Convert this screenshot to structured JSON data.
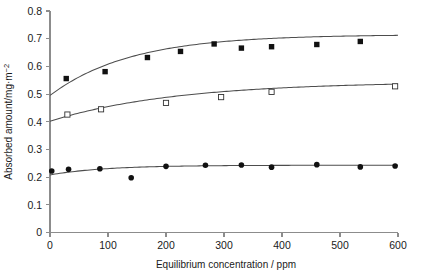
{
  "chart_data": {
    "type": "scatter",
    "title": "",
    "xlabel": "Equilibrium concentration / ppm",
    "ylabel": "Absorbed amount/mg·m",
    "ylabel_superscript": "−2",
    "xlim": [
      0,
      600
    ],
    "ylim": [
      0,
      0.8
    ],
    "xticks": [
      0,
      100,
      200,
      300,
      400,
      500,
      600
    ],
    "xticklabels": [
      "0",
      "100",
      "200",
      "300",
      "400",
      "500",
      "600"
    ],
    "yticks": [
      0,
      0.1,
      0.2,
      0.3,
      0.4,
      0.5,
      0.6,
      0.7,
      0.8
    ],
    "yticklabels": [
      "0",
      "0.1",
      "0.2",
      "0.3",
      "0.4",
      "0.5",
      "0.6",
      "0.7",
      "0.8"
    ],
    "grid": false,
    "legend": "none",
    "series": [
      {
        "name": "Series 1",
        "marker": "filled-square",
        "points": [
          {
            "x": 28,
            "y": 0.556
          },
          {
            "x": 95,
            "y": 0.581
          },
          {
            "x": 168,
            "y": 0.632
          },
          {
            "x": 225,
            "y": 0.654
          },
          {
            "x": 283,
            "y": 0.681
          },
          {
            "x": 330,
            "y": 0.666
          },
          {
            "x": 382,
            "y": 0.671
          },
          {
            "x": 460,
            "y": 0.679
          },
          {
            "x": 535,
            "y": 0.69
          }
        ],
        "fit": {
          "type": "langmuir",
          "y0": 0.495,
          "ymax": 0.715,
          "k": 0.0072,
          "xrange": [
            0,
            600
          ]
        }
      },
      {
        "name": "Series 2",
        "marker": "open-square",
        "points": [
          {
            "x": 30,
            "y": 0.426
          },
          {
            "x": 88,
            "y": 0.445
          },
          {
            "x": 200,
            "y": 0.468
          },
          {
            "x": 295,
            "y": 0.489
          },
          {
            "x": 382,
            "y": 0.508
          },
          {
            "x": 595,
            "y": 0.528
          }
        ],
        "fit": {
          "type": "langmuir",
          "y0": 0.402,
          "ymax": 0.545,
          "k": 0.0046,
          "xrange": [
            0,
            600
          ]
        }
      },
      {
        "name": "Series 3",
        "marker": "filled-circle",
        "points": [
          {
            "x": 3,
            "y": 0.222
          },
          {
            "x": 32,
            "y": 0.228
          },
          {
            "x": 86,
            "y": 0.23
          },
          {
            "x": 140,
            "y": 0.198
          },
          {
            "x": 200,
            "y": 0.239
          },
          {
            "x": 268,
            "y": 0.243
          },
          {
            "x": 330,
            "y": 0.244
          },
          {
            "x": 382,
            "y": 0.236
          },
          {
            "x": 460,
            "y": 0.245
          },
          {
            "x": 535,
            "y": 0.237
          },
          {
            "x": 595,
            "y": 0.24
          }
        ],
        "fit": {
          "type": "langmuir",
          "y0": 0.208,
          "ymax": 0.243,
          "k": 0.0105,
          "xrange": [
            0,
            600
          ]
        }
      }
    ]
  },
  "figure": {
    "background_color": "#ffffff",
    "axis_color": "#8c8c8c",
    "curve_color": "#4d4d4d",
    "marker_color": "#111111"
  }
}
